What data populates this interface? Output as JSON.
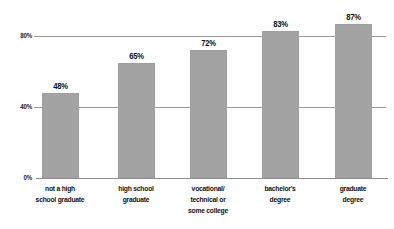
{
  "chart_data": {
    "type": "bar",
    "title": "",
    "subtitle": "",
    "xlabel": "",
    "ylabel": "",
    "ylim": [
      0,
      100
    ],
    "yticks": [
      "0%",
      "40%",
      "80%"
    ],
    "ytick_values": [
      0,
      40,
      80
    ],
    "grid": true,
    "legend": "none",
    "orientation": "vertical",
    "bar_color": "#a3a3a3",
    "gridline_color": "#9a9a9a",
    "background_color": "#ffffff",
    "label_color": "#111111",
    "categories": [
      "not a high school graduate",
      "high school graduate",
      "vocational/ technical or some college",
      "bachelor's degree",
      "graduate degree"
    ],
    "category_lines": [
      [
        "not a high",
        "school graduate"
      ],
      [
        "high school",
        "graduate"
      ],
      [
        "vocational/",
        "technical or",
        "some college"
      ],
      [
        "bachelor's",
        "degree"
      ],
      [
        "graduate",
        "degree"
      ]
    ],
    "values": [
      48,
      65,
      72,
      83,
      87
    ],
    "value_labels": [
      "48%",
      "65%",
      "72%",
      "83%",
      "87%"
    ]
  },
  "axis": {
    "y": {
      "tick_0": "0%",
      "tick_40": "40%",
      "tick_80": "80%"
    }
  },
  "bars": [
    {
      "label": "48%",
      "value": 48,
      "line1": "not a high",
      "line2": "school graduate",
      "line3": ""
    },
    {
      "label": "65%",
      "value": 65,
      "line1": "high school",
      "line2": "graduate",
      "line3": ""
    },
    {
      "label": "72%",
      "value": 72,
      "line1": "vocational/",
      "line2": "technical or",
      "line3": "some college"
    },
    {
      "label": "83%",
      "value": 83,
      "line1": "bachelor's",
      "line2": "degree",
      "line3": ""
    },
    {
      "label": "87%",
      "value": 87,
      "line1": "graduate",
      "line2": "degree",
      "line3": ""
    }
  ]
}
